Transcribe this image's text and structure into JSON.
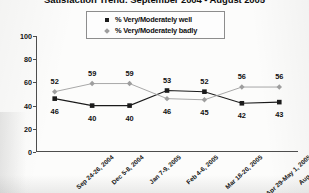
{
  "title": "Satisfaction Trend: September 2004 - August 2005",
  "legend": {
    "position": "top-center",
    "items": [
      {
        "label": "% Very/Moderately well",
        "marker": "square-marker-icon",
        "color": "#1b1b1b"
      },
      {
        "label": "% Very/Moderately badly",
        "marker": "diamond-marker-icon",
        "color": "#9e9e9e"
      }
    ]
  },
  "axes": {
    "y_ticks": [
      "0",
      "20",
      "40",
      "60",
      "80",
      "100"
    ],
    "x_labels": [
      "Sep 24-26, 2004",
      "Dec 5-8, 2004",
      "Jan 7-9, 2005",
      "Feb 4-6, 2005",
      "Mar 18-20, 2005",
      "Apr 29-May 1, 2005",
      "Aug 5-7, 2005"
    ]
  },
  "chart_data": {
    "type": "line",
    "title": "Satisfaction Trend: September 2004 - August 2005",
    "xlabel": "",
    "ylabel": "",
    "ylim": [
      0,
      100
    ],
    "ytick_step": 20,
    "grid": false,
    "legend_position": "top-center",
    "categories": [
      "Sep 24-26, 2004",
      "Dec 5-8, 2004",
      "Jan 7-9, 2005",
      "Feb 4-6, 2005",
      "Mar 18-20, 2005",
      "Apr 29-May 1, 2005",
      "Aug 5-7, 2005"
    ],
    "series": [
      {
        "name": "% Very/Moderately well",
        "marker": "square",
        "color": "#1b1b1b",
        "values": [
          46,
          40,
          40,
          53,
          52,
          42,
          43
        ]
      },
      {
        "name": "% Very/Moderately badly",
        "marker": "diamond",
        "color": "#9e9e9e",
        "values": [
          52,
          59,
          59,
          46,
          45,
          56,
          56
        ]
      }
    ]
  }
}
